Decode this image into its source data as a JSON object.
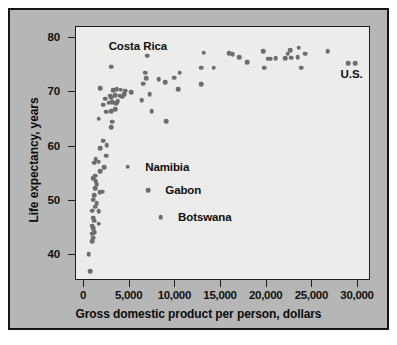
{
  "chart_data": {
    "type": "scatter",
    "title": "",
    "xlabel": "Gross domestic product per person, dollars",
    "ylabel": "Life expectancy, years",
    "xlim": [
      0,
      32000
    ],
    "ylim": [
      35.5,
      81.5
    ],
    "grid": false,
    "legend": null,
    "xticks": [
      {
        "value": 0,
        "label": "0"
      },
      {
        "value": 5000,
        "label": "5,000"
      },
      {
        "value": 10000,
        "label": "10,000"
      },
      {
        "value": 15000,
        "label": "15,000"
      },
      {
        "value": 20000,
        "label": "20,000"
      },
      {
        "value": 25000,
        "label": "25,000"
      },
      {
        "value": 30000,
        "label": "30,000"
      }
    ],
    "yticks": [
      {
        "value": 40,
        "label": "40"
      },
      {
        "value": 50,
        "label": "50"
      },
      {
        "value": 60,
        "label": "60"
      },
      {
        "value": 70,
        "label": "70"
      },
      {
        "value": 80,
        "label": "80"
      }
    ],
    "marker": {
      "shape": "circle",
      "color": "#6d6d6d",
      "size_px": 4.6
    },
    "points": [
      [
        700,
        37.0
      ],
      [
        500,
        40.1
      ],
      [
        900,
        42.5
      ],
      [
        1000,
        43.2
      ],
      [
        900,
        43.9
      ],
      [
        1100,
        44.2
      ],
      [
        1000,
        44.9
      ],
      [
        900,
        45.4
      ],
      [
        1600,
        45.8
      ],
      [
        1100,
        46.3
      ],
      [
        1000,
        46.9
      ],
      [
        900,
        48.2
      ],
      [
        1600,
        48.1
      ],
      [
        1200,
        48.9
      ],
      [
        1400,
        49.6
      ],
      [
        1000,
        50.2
      ],
      [
        1100,
        51.0
      ],
      [
        1700,
        51.6
      ],
      [
        2000,
        51.7
      ],
      [
        1200,
        52.3
      ],
      [
        1400,
        53.1
      ],
      [
        1300,
        53.6
      ],
      [
        1000,
        54.2
      ],
      [
        1200,
        54.6
      ],
      [
        1800,
        55.4
      ],
      [
        2200,
        56.2
      ],
      [
        4800,
        56.3
      ],
      [
        1100,
        57.0
      ],
      [
        1600,
        57.2
      ],
      [
        1300,
        57.7
      ],
      [
        2400,
        58.3
      ],
      [
        7000,
        51.9
      ],
      [
        1800,
        59.7
      ],
      [
        2500,
        60.2
      ],
      [
        8400,
        47.0
      ],
      [
        2100,
        61.1
      ],
      [
        3000,
        63.6
      ],
      [
        1600,
        65.1
      ],
      [
        3100,
        64.6
      ],
      [
        9000,
        64.7
      ],
      [
        2400,
        66.4
      ],
      [
        3000,
        66.5
      ],
      [
        2100,
        67.7
      ],
      [
        3400,
        66.9
      ],
      [
        7400,
        66.5
      ],
      [
        2700,
        68.1
      ],
      [
        3500,
        68.0
      ],
      [
        3100,
        68.2
      ],
      [
        3700,
        68.4
      ],
      [
        2300,
        68.8
      ],
      [
        3000,
        69.0
      ],
      [
        6300,
        68.5
      ],
      [
        4200,
        69.2
      ],
      [
        2900,
        69.4
      ],
      [
        3400,
        69.5
      ],
      [
        3900,
        69.4
      ],
      [
        4400,
        69.6
      ],
      [
        7200,
        69.6
      ],
      [
        1800,
        70.7
      ],
      [
        3200,
        70.4
      ],
      [
        3600,
        70.6
      ],
      [
        4500,
        70.3
      ],
      [
        4000,
        70.5
      ],
      [
        5200,
        70.0
      ],
      [
        10300,
        70.6
      ],
      [
        12800,
        71.5
      ],
      [
        6500,
        71.6
      ],
      [
        8900,
        71.8
      ],
      [
        8200,
        72.4
      ],
      [
        6800,
        72.6
      ],
      [
        9900,
        72.7
      ],
      [
        10500,
        73.6
      ],
      [
        6700,
        73.6
      ],
      [
        3000,
        74.7
      ],
      [
        12800,
        74.5
      ],
      [
        14200,
        74.5
      ],
      [
        19700,
        74.5
      ],
      [
        23800,
        74.5
      ],
      [
        28900,
        75.3
      ],
      [
        29700,
        75.4
      ],
      [
        17900,
        75.5
      ],
      [
        20100,
        76.2
      ],
      [
        20400,
        76.2
      ],
      [
        21000,
        76.3
      ],
      [
        22000,
        76.3
      ],
      [
        22700,
        76.4
      ],
      [
        23400,
        76.5
      ],
      [
        17000,
        76.5
      ],
      [
        16300,
        77.0
      ],
      [
        22300,
        77.1
      ],
      [
        24200,
        77.1
      ],
      [
        15900,
        77.2
      ],
      [
        13100,
        77.3
      ],
      [
        19600,
        77.6
      ],
      [
        22600,
        77.7
      ],
      [
        26700,
        77.6
      ],
      [
        23500,
        78.2
      ],
      [
        6900,
        76.7
      ]
    ],
    "annotations": [
      {
        "label": "Costa Rica",
        "x": 6900,
        "y": 76.7,
        "text_x": 5900,
        "text_y": 78.6,
        "anchor": "center"
      },
      {
        "label": "U.S.",
        "x": 29300,
        "y": 75.3,
        "text_x": 29300,
        "text_y": 73.4,
        "anchor": "center"
      },
      {
        "label": "Namibia",
        "x": 4800,
        "y": 56.3,
        "text_x": 6700,
        "text_y": 56.3,
        "anchor": "left"
      },
      {
        "label": "Gabon",
        "x": 7000,
        "y": 51.9,
        "text_x": 8900,
        "text_y": 51.9,
        "anchor": "left"
      },
      {
        "label": "Botswana",
        "x": 8400,
        "y": 47.0,
        "text_x": 10300,
        "text_y": 47.0,
        "anchor": "left"
      }
    ]
  },
  "figure": {
    "panel_color": "#b6b6b6",
    "plot_background": "#ececea",
    "frame_color": "#1d1d1d",
    "marker_color": "#6d6d6d",
    "text_color": "#101010"
  }
}
